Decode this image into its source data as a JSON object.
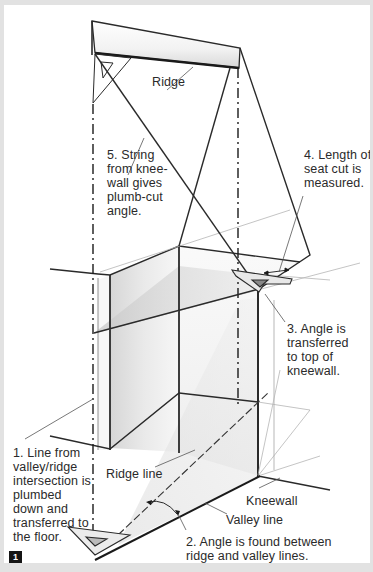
{
  "figure": {
    "number": "1",
    "border_color": "#e2e2e2",
    "background": "#ffffff",
    "line_color": "#2a2a2a"
  },
  "labels": {
    "ridge": "Ridge",
    "step5": "5. String\nfrom knee-\nwall gives\nplumb-cut\nangle.",
    "step4": "4. Length of\nseat cut is\nmeasured.",
    "step3": "3. Angle is\ntransferred\nto top of\nkneewall.",
    "step1": "1. Line from\nvalley/ridge\nintersection is\nplumbed\ndown and\ntransferred to\nthe floor.",
    "ridge_line": "Ridge line",
    "kneewall": "Kneewall",
    "valley_line": "Valley line",
    "step2": "2. Angle is found between\nridge and valley lines."
  }
}
